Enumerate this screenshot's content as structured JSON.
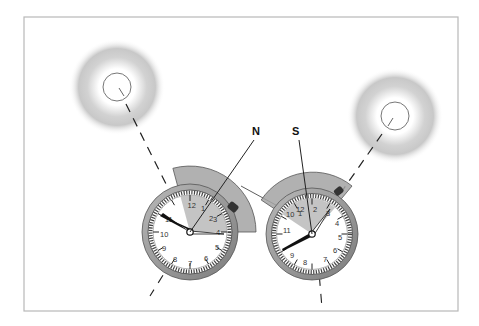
{
  "figure": {
    "labels": {
      "north": "N",
      "south": "S"
    },
    "colors": {
      "frame": "#b8b8b8",
      "sector": "#9c9c9c",
      "bezel": "#8e8e8e",
      "hand": "#111111",
      "glow": "#9a9a9a"
    },
    "left_watch": {
      "hemisphere": "northern",
      "numerals": [
        "12",
        "1",
        "2",
        "3",
        "4",
        "5",
        "6",
        "7",
        "8",
        "9",
        "10",
        "11"
      ],
      "hour_hand_angle_deg": -60,
      "minute_hand_angle_deg": 95,
      "direction_label": "N"
    },
    "right_watch": {
      "hemisphere": "southern",
      "numerals": [
        "12",
        "1",
        "2",
        "3",
        "4",
        "5",
        "6",
        "7",
        "8",
        "9",
        "10",
        "11"
      ],
      "hour_hand_angle_deg": -112,
      "minute_hand_angle_deg": 35,
      "direction_label": "S"
    },
    "suns": [
      {
        "name": "left-sun"
      },
      {
        "name": "right-sun"
      }
    ]
  }
}
